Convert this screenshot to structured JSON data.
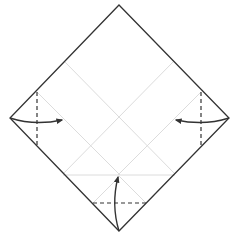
{
  "diagram": {
    "type": "origami-fold-step",
    "colors": {
      "background": "#ffffff",
      "outline": "#333333",
      "crease": "#dcdcdc",
      "valley_fold": "#333333",
      "arrow": "#333333"
    },
    "paper": {
      "shape": "diamond",
      "points": [
        [
          119,
          5
        ],
        [
          229,
          118
        ],
        [
          119,
          231
        ],
        [
          10,
          118
        ]
      ]
    },
    "creases": [
      [
        65,
        62,
        175,
        174
      ],
      [
        173,
        62,
        63,
        174
      ],
      [
        63,
        175,
        175,
        175
      ],
      [
        37,
        92,
        120,
        175
      ],
      [
        201,
        92,
        118,
        175
      ],
      [
        93,
        203,
        120,
        176
      ],
      [
        146,
        203,
        119,
        176
      ]
    ],
    "valley_folds": [
      [
        37,
        92,
        37,
        146
      ],
      [
        201,
        92,
        201,
        146
      ],
      [
        93,
        203,
        146,
        203
      ]
    ],
    "arrows": [
      {
        "name": "left-corner-arrow",
        "path": "M10,118 Q35,126 62,120",
        "head": [
          62,
          120
        ]
      },
      {
        "name": "right-corner-arrow",
        "path": "M229,118 Q204,126 176,120",
        "head": [
          176,
          120
        ]
      },
      {
        "name": "bottom-corner-arrow",
        "path": "M119,231 Q111,205 118,177",
        "head": [
          118,
          177
        ]
      }
    ]
  }
}
